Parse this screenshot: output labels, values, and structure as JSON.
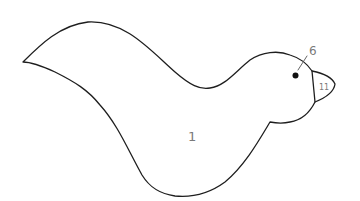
{
  "drawing": {
    "subject": "bird outline coloring page",
    "stroke_color": "#1e1e1e",
    "background_color": "#ffffff",
    "label_color": "#7a7a7a"
  },
  "regions": [
    {
      "id": "body",
      "label": "1"
    },
    {
      "id": "eye",
      "label": "6"
    },
    {
      "id": "beak",
      "label": "11"
    }
  ]
}
